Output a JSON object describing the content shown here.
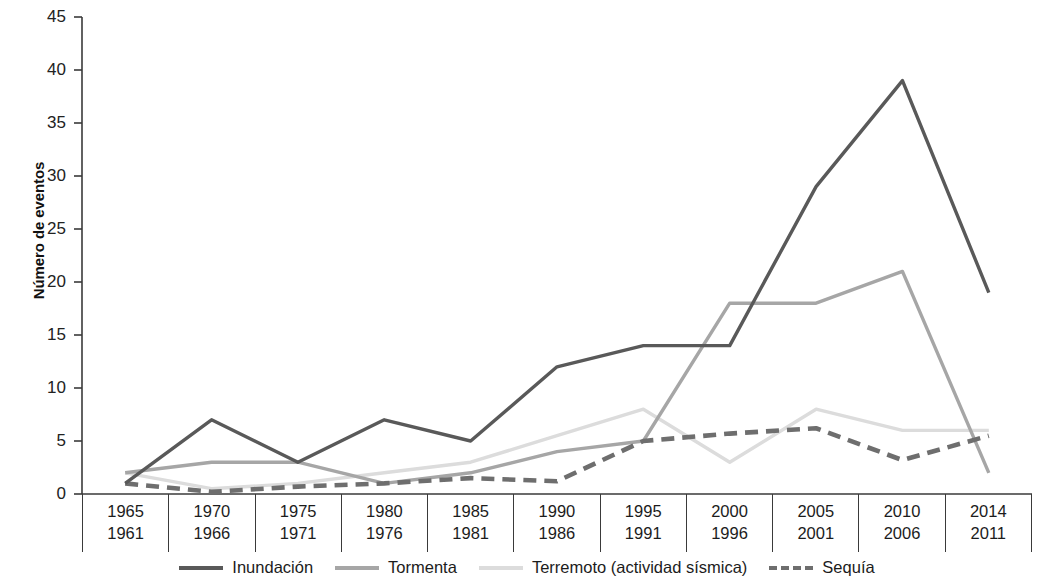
{
  "chart_data": {
    "type": "line",
    "title": "",
    "xlabel": "",
    "ylabel": "Número de eventos",
    "ylim": [
      0,
      45
    ],
    "ytick_step": 5,
    "yticks": [
      0,
      5,
      10,
      15,
      20,
      25,
      30,
      35,
      40,
      45
    ],
    "grid": false,
    "legend_position": "bottom",
    "categories": [
      "1961-1965",
      "1966-1970",
      "1971-1975",
      "1976-1980",
      "1981-1985",
      "1986-1990",
      "1991-1995",
      "1996-2000",
      "2001-2005",
      "2006-2010",
      "2011-2014"
    ],
    "period_start_years": [
      "1961",
      "1966",
      "1971",
      "1976",
      "1981",
      "1986",
      "1991",
      "1996",
      "2001",
      "2006",
      "2011"
    ],
    "period_end_years": [
      "1965",
      "1970",
      "1975",
      "1980",
      "1985",
      "1990",
      "1995",
      "2000",
      "2005",
      "2010",
      "2014"
    ],
    "series": [
      {
        "name": "Inundación",
        "color": "#595959",
        "style": "solid",
        "values": [
          1,
          7,
          3,
          7,
          5,
          12,
          14,
          14,
          29,
          39,
          19
        ]
      },
      {
        "name": "Tormenta",
        "color": "#a6a6a6",
        "style": "solid",
        "values": [
          2,
          3,
          3,
          1,
          2,
          4,
          5,
          18,
          18,
          21,
          2
        ]
      },
      {
        "name": "Terremoto (actividad sísmica)",
        "color": "#dcdcdc",
        "style": "solid",
        "values": [
          2,
          0.5,
          1,
          2,
          3,
          5.5,
          8,
          3,
          8,
          6,
          6
        ]
      },
      {
        "name": "Sequía",
        "color": "#6e6e6e",
        "style": "dashed",
        "values": [
          1,
          0.2,
          0.7,
          1,
          1.5,
          1.2,
          5,
          5.7,
          6.2,
          3.2,
          5.5
        ]
      }
    ]
  },
  "axis": {
    "y_title": "Número de eventos",
    "y_tick_labels": [
      "45",
      "40",
      "35",
      "30",
      "25",
      "20",
      "15",
      "10",
      "5",
      "0"
    ]
  },
  "legend": {
    "items": [
      {
        "label": "Inundación",
        "color": "#595959",
        "style": "solid"
      },
      {
        "label": "Tormenta",
        "color": "#a6a6a6",
        "style": "solid"
      },
      {
        "label": "Terremoto (actividad sísmica)",
        "color": "#dcdcdc",
        "style": "solid"
      },
      {
        "label": "Sequía",
        "color": "#6e6e6e",
        "style": "dashed"
      }
    ]
  }
}
